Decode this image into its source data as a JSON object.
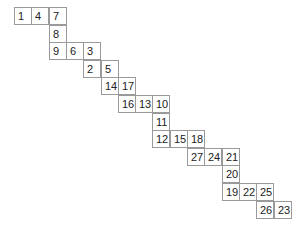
{
  "diagram": {
    "type": "grid-path",
    "cell_width": 17.3,
    "cell_height": 17.6,
    "origin_x": 14,
    "origin_y": 7,
    "cells": [
      {
        "value": "1",
        "row": 0,
        "col": 0
      },
      {
        "value": "4",
        "row": 0,
        "col": 1
      },
      {
        "value": "7",
        "row": 0,
        "col": 2
      },
      {
        "value": "8",
        "row": 1,
        "col": 2
      },
      {
        "value": "9",
        "row": 2,
        "col": 2
      },
      {
        "value": "6",
        "row": 2,
        "col": 3
      },
      {
        "value": "3",
        "row": 2,
        "col": 4
      },
      {
        "value": "2",
        "row": 3,
        "col": 4
      },
      {
        "value": "5",
        "row": 3,
        "col": 5
      },
      {
        "value": "14",
        "row": 4,
        "col": 5
      },
      {
        "value": "17",
        "row": 4,
        "col": 6
      },
      {
        "value": "16",
        "row": 5,
        "col": 6
      },
      {
        "value": "13",
        "row": 5,
        "col": 7
      },
      {
        "value": "10",
        "row": 5,
        "col": 8
      },
      {
        "value": "11",
        "row": 6,
        "col": 8
      },
      {
        "value": "12",
        "row": 7,
        "col": 8
      },
      {
        "value": "15",
        "row": 7,
        "col": 9
      },
      {
        "value": "18",
        "row": 7,
        "col": 10
      },
      {
        "value": "27",
        "row": 8,
        "col": 10
      },
      {
        "value": "24",
        "row": 8,
        "col": 11
      },
      {
        "value": "21",
        "row": 8,
        "col": 12
      },
      {
        "value": "20",
        "row": 9,
        "col": 12
      },
      {
        "value": "19",
        "row": 10,
        "col": 12
      },
      {
        "value": "22",
        "row": 10,
        "col": 13
      },
      {
        "value": "25",
        "row": 10,
        "col": 14
      },
      {
        "value": "26",
        "row": 11,
        "col": 14
      },
      {
        "value": "23",
        "row": 11,
        "col": 15
      }
    ]
  }
}
